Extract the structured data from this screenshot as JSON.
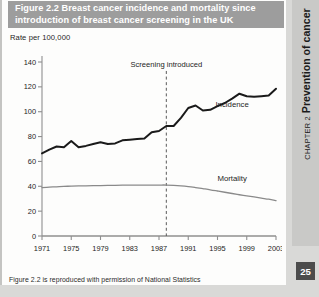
{
  "figure": {
    "number": "Figure 2.2",
    "title": "Breast cancer incidence and mortality since introduction of breast cancer screening in the UK",
    "title_line1": "Figure 2.2  Breast cancer incidence and mortality since",
    "title_line2": "introduction of breast cancer screening in the UK",
    "source_note": "Figure 2.2 is reproduced with permission of National Statistics"
  },
  "sidebar": {
    "chapter_kicker": "CHAPTER 2",
    "chapter_title": "Prevention of cancer",
    "page_number": "25"
  },
  "colors": {
    "title_bar": "#9d9d9d",
    "title_text": "#ffffff",
    "incidence_line": "#1a1a1a",
    "mortality_line": "#8a8a8a",
    "axis": "#8f8f8f",
    "annotation_line": "#5a5a5a",
    "card_background": "#fdfdfc",
    "page_background": "#d9d9d7",
    "side_tab": "#c9c9c7",
    "page_number_box": "#4c4c4c"
  },
  "chart_data": {
    "type": "line",
    "title": "Breast cancer incidence and mortality since introduction of breast cancer screening in the UK",
    "xlabel": "",
    "ylabel": "Rate per 100,000",
    "ylim": [
      0,
      140
    ],
    "yticks": [
      0,
      20,
      40,
      60,
      80,
      100,
      120,
      140
    ],
    "ytick_labels": [
      "0",
      "20",
      "40",
      "60",
      "80",
      "100",
      "120",
      "140"
    ],
    "xlim": [
      1971,
      2003
    ],
    "xticks": [
      1971,
      1975,
      1979,
      1983,
      1987,
      1991,
      1995,
      1999,
      2003
    ],
    "xtick_labels": [
      "1971",
      "1975",
      "1979",
      "1983",
      "1987",
      "1991",
      "1995",
      "1999",
      "2003"
    ],
    "grid": false,
    "legend": "inline-labels",
    "annotations": [
      {
        "text": "Screening introduced",
        "type": "vertical-dashed-line",
        "x": 1988,
        "label_y": 136
      }
    ],
    "x": [
      1971,
      1972,
      1973,
      1974,
      1975,
      1976,
      1977,
      1978,
      1979,
      1980,
      1981,
      1982,
      1983,
      1984,
      1985,
      1986,
      1987,
      1988,
      1989,
      1990,
      1991,
      1992,
      1993,
      1994,
      1995,
      1996,
      1997,
      1998,
      1999,
      2000,
      2001,
      2002,
      2003
    ],
    "series": [
      {
        "name": "Incidence",
        "label": "Incidence",
        "color": "#1a1a1a",
        "label_at": {
          "x": 1997,
          "y": 104
        },
        "values": [
          66.5,
          69.5,
          72.0,
          71.5,
          76.5,
          71.5,
          72.5,
          74.0,
          75.5,
          74.0,
          74.5,
          77.0,
          77.5,
          78.0,
          78.5,
          83.5,
          84.5,
          88.5,
          88.5,
          95.0,
          103.0,
          105.0,
          101.0,
          101.5,
          104.5,
          107.0,
          110.5,
          114.5,
          112.5,
          112.0,
          112.5,
          113.0,
          118.5
        ]
      },
      {
        "name": "Mortality",
        "label": "Mortality",
        "color": "#8a8a8a",
        "label_at": {
          "x": 1997,
          "y": 44
        },
        "values": [
          39.0,
          39.3,
          39.6,
          39.9,
          40.1,
          40.3,
          40.4,
          40.5,
          40.6,
          40.7,
          40.8,
          40.9,
          41.0,
          41.0,
          41.0,
          41.0,
          41.0,
          41.0,
          40.8,
          40.4,
          39.8,
          39.0,
          38.1,
          37.2,
          36.2,
          35.2,
          34.2,
          33.2,
          32.3,
          31.4,
          30.5,
          29.6,
          28.5
        ]
      }
    ]
  }
}
